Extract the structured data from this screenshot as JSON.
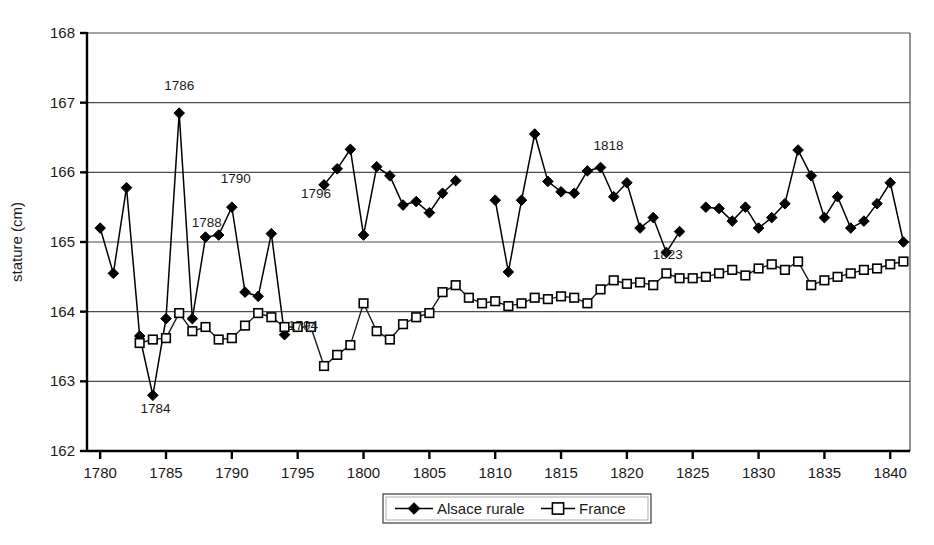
{
  "chart_data": {
    "type": "line",
    "title": "",
    "xlabel": "",
    "ylabel": "stature (cm)",
    "xlim": [
      1779,
      1841.5
    ],
    "ylim": [
      162,
      168
    ],
    "xticks": [
      1780,
      1785,
      1790,
      1795,
      1800,
      1805,
      1810,
      1815,
      1820,
      1825,
      1830,
      1835,
      1840
    ],
    "xticklabels": [
      "1780",
      "1785",
      "1790",
      "1795",
      "1800",
      "1805",
      "1810",
      "1815",
      "1820",
      "1825",
      "1830",
      "1835",
      "1840"
    ],
    "yticks": [
      162,
      163,
      164,
      165,
      166,
      167,
      168
    ],
    "yticklabels": [
      "162",
      "163",
      "164",
      "165",
      "166",
      "167",
      "168"
    ],
    "grid": true,
    "legend_position": "bottom",
    "series": [
      {
        "name": "Alsace rurale",
        "marker": "filled-diamond",
        "x": [
          1780,
          1781,
          1782,
          1783,
          1784,
          1785,
          1786,
          1787,
          1788,
          1789,
          1790,
          1791,
          1792,
          1793,
          1794,
          1797,
          1798,
          1799,
          1800,
          1801,
          1802,
          1803,
          1804,
          1805,
          1806,
          1807,
          1810,
          1811,
          1812,
          1813,
          1814,
          1815,
          1816,
          1817,
          1818,
          1819,
          1820,
          1821,
          1822,
          1823,
          1824,
          1826,
          1827,
          1828,
          1829,
          1830,
          1831,
          1832,
          1833,
          1834,
          1835,
          1836,
          1837,
          1838,
          1839,
          1840,
          1841
        ],
        "values": [
          165.2,
          164.55,
          165.78,
          163.65,
          162.8,
          163.9,
          166.85,
          163.9,
          165.07,
          165.1,
          165.5,
          164.28,
          164.22,
          165.12,
          163.67,
          165.82,
          166.05,
          166.33,
          165.1,
          166.08,
          165.95,
          165.53,
          165.58,
          165.42,
          165.7,
          165.88,
          165.6,
          164.57,
          165.6,
          166.55,
          165.87,
          165.72,
          165.7,
          166.02,
          166.07,
          165.65,
          165.85,
          165.2,
          165.35,
          164.85,
          165.15,
          165.5,
          165.48,
          165.3,
          165.5,
          165.2,
          165.35,
          165.55,
          166.32,
          165.95,
          165.35,
          165.65,
          165.2,
          165.3,
          165.55,
          165.85,
          165.0
        ]
      },
      {
        "name": "France",
        "marker": "open-square",
        "x": [
          1783,
          1784,
          1785,
          1786,
          1787,
          1788,
          1789,
          1790,
          1791,
          1792,
          1793,
          1794,
          1795,
          1796,
          1797,
          1798,
          1799,
          1800,
          1801,
          1802,
          1803,
          1804,
          1805,
          1806,
          1807,
          1808,
          1809,
          1810,
          1811,
          1812,
          1813,
          1814,
          1815,
          1816,
          1817,
          1818,
          1819,
          1820,
          1821,
          1822,
          1823,
          1824,
          1825,
          1826,
          1827,
          1828,
          1829,
          1830,
          1831,
          1832,
          1833,
          1834,
          1835,
          1836,
          1837,
          1838,
          1839,
          1840,
          1841
        ],
        "values": [
          163.55,
          163.6,
          163.62,
          163.98,
          163.72,
          163.78,
          163.6,
          163.62,
          163.8,
          163.98,
          163.92,
          163.78,
          163.78,
          163.78,
          163.22,
          163.38,
          163.52,
          164.12,
          163.72,
          163.6,
          163.82,
          163.92,
          163.98,
          164.28,
          164.38,
          164.2,
          164.12,
          164.15,
          164.08,
          164.12,
          164.2,
          164.18,
          164.22,
          164.2,
          164.12,
          164.32,
          164.45,
          164.4,
          164.42,
          164.38,
          164.55,
          164.48,
          164.48,
          164.5,
          164.55,
          164.6,
          164.52,
          164.62,
          164.68,
          164.6,
          164.72,
          164.38,
          164.45,
          164.5,
          164.55,
          164.6,
          164.62,
          164.68,
          164.72
        ]
      }
    ],
    "annotations": [
      {
        "text": "1786",
        "x": 1786,
        "y": 167.18,
        "anchor": "middle"
      },
      {
        "text": "1788",
        "x": 1788.1,
        "y": 165.22,
        "anchor": "middle"
      },
      {
        "text": "1790",
        "x": 1790.3,
        "y": 165.85,
        "anchor": "middle"
      },
      {
        "text": "1784",
        "x": 1784.2,
        "y": 162.55,
        "anchor": "middle"
      },
      {
        "text": "1794",
        "x": 1795.4,
        "y": 163.73,
        "anchor": "middle"
      },
      {
        "text": "1796",
        "x": 1796.4,
        "y": 165.63,
        "anchor": "middle"
      },
      {
        "text": "1818",
        "x": 1818.6,
        "y": 166.32,
        "anchor": "middle"
      },
      {
        "text": "1823",
        "x": 1823.1,
        "y": 164.75,
        "anchor": "middle"
      }
    ],
    "colors": {
      "alsace": "#000000",
      "france": "#ffffff",
      "grid": "#4d4d4d",
      "axis": "#000000",
      "background": "#ffffff"
    }
  },
  "legend": {
    "items": [
      {
        "label": "Alsace rurale",
        "marker": "filled-diamond"
      },
      {
        "label": "France",
        "marker": "open-square"
      }
    ]
  }
}
